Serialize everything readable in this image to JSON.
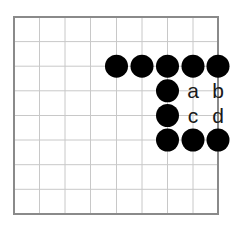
{
  "diagram": {
    "type": "go-board-diagram",
    "grid": {
      "columns": 9,
      "rows": 9,
      "x_lines": [
        14,
        39.5,
        65,
        90.5,
        116.5,
        142,
        167.5,
        193,
        218
      ],
      "y_lines": [
        17,
        41.6,
        66.2,
        90.8,
        115.5,
        140,
        164.7,
        189.3,
        214
      ],
      "border_color": "#8a8a8a",
      "line_color": "#c8c8c8"
    },
    "stones": [
      {
        "color": "black",
        "col": 4,
        "row": 2
      },
      {
        "color": "black",
        "col": 5,
        "row": 2
      },
      {
        "color": "black",
        "col": 6,
        "row": 2
      },
      {
        "color": "black",
        "col": 7,
        "row": 2
      },
      {
        "color": "black",
        "col": 8,
        "row": 2
      },
      {
        "color": "black",
        "col": 6,
        "row": 3
      },
      {
        "color": "black",
        "col": 6,
        "row": 4
      },
      {
        "color": "black",
        "col": 6,
        "row": 5
      },
      {
        "color": "black",
        "col": 7,
        "row": 5
      },
      {
        "color": "black",
        "col": 8,
        "row": 5
      }
    ],
    "labels": [
      {
        "text": "a",
        "col": 7,
        "row": 3
      },
      {
        "text": "b",
        "col": 8,
        "row": 3
      },
      {
        "text": "c",
        "col": 7,
        "row": 4
      },
      {
        "text": "d",
        "col": 8,
        "row": 4
      }
    ],
    "stone_radius": 11.5,
    "stone_color": "#000000"
  }
}
